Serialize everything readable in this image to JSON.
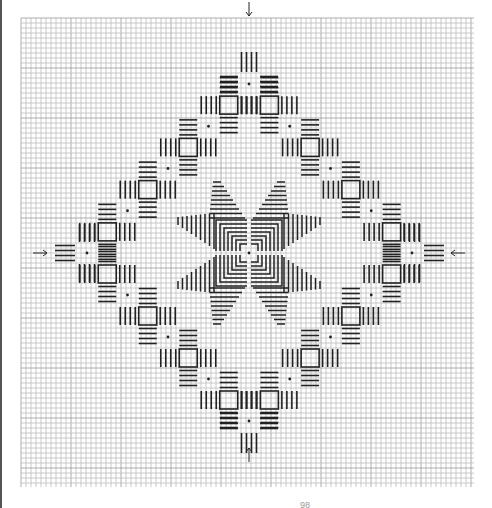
{
  "figure": {
    "type": "stitch-pattern-chart",
    "grid": {
      "x0": 21,
      "y0": 18,
      "x1": 474,
      "y1": 487,
      "cell": 5,
      "minor_color": "#bdbdbd",
      "major_color": "#9a9a9a"
    },
    "ink_color": "#222222",
    "center": {
      "x": 249,
      "y": 253
    },
    "diamond": {
      "top": [
        249,
        84
      ],
      "right": [
        412,
        253
      ],
      "bottom": [
        249,
        421
      ],
      "left": [
        87,
        253
      ],
      "dots_per_side": 4
    },
    "arrows": [
      {
        "name": "arrow-top",
        "direction": "down",
        "x": 249,
        "y": 2
      },
      {
        "name": "arrow-bottom",
        "direction": "up",
        "x": 249,
        "y": 462
      },
      {
        "name": "arrow-left",
        "direction": "right",
        "x": 33,
        "y": 253
      },
      {
        "name": "arrow-right",
        "direction": "left",
        "x": 465,
        "y": 253
      }
    ],
    "page_number": "98"
  }
}
